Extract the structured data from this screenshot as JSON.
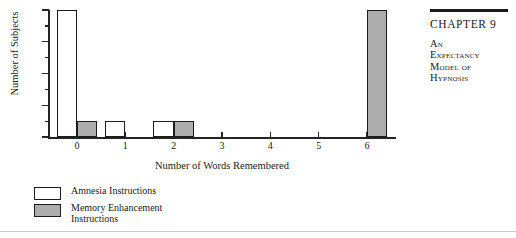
{
  "chart_data": {
    "type": "bar",
    "title": "",
    "xlabel": "Number of Words Remembered",
    "ylabel": "Number of Subjects",
    "categories": [
      "0",
      "1",
      "2",
      "3",
      "4",
      "5",
      "6"
    ],
    "x": [
      0,
      1,
      2,
      3,
      4,
      5,
      6
    ],
    "xlim": [
      -0.6,
      6.6
    ],
    "ylim": [
      0,
      8
    ],
    "ytick_labels": [
      "0",
      "2",
      "4",
      "6",
      "8"
    ],
    "ytick_values": [
      0,
      2,
      4,
      6,
      8
    ],
    "yminor_values": [
      1,
      3,
      5,
      7
    ],
    "grid": false,
    "legend_position": "below-left",
    "series": [
      {
        "name": "Amnesia Instructions",
        "color": "#ffffff",
        "edge_color": "#1c1c1c",
        "values": [
          8,
          1,
          1,
          0,
          0,
          0,
          0
        ]
      },
      {
        "name": "Memory Enhancement Instructions",
        "color": "#adadad",
        "edge_color": "#1c1c1c",
        "values": [
          1,
          0,
          1,
          0,
          0,
          0,
          8
        ]
      }
    ]
  },
  "legend": {
    "items": [
      {
        "label": "Amnesia Instructions",
        "swatch": "white"
      },
      {
        "label": "Memory Enhancement\nInstructions",
        "swatch": "gray"
      }
    ]
  },
  "chapter": {
    "title": "CHAPTER 9",
    "subtitle_lines": [
      "An",
      "Expectancy",
      "Model of",
      "Hypnosis"
    ]
  }
}
